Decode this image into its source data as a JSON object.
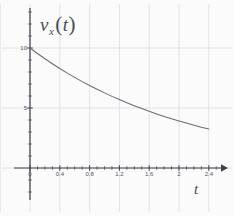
{
  "chart_data": {
    "type": "line",
    "title": "",
    "subtitle": "",
    "ylabel": "v_x(t)",
    "ylabel_parts": {
      "symbol": "v",
      "subscript": "x",
      "argument": "t"
    },
    "xlabel": "t",
    "xlim": [
      0,
      2.55
    ],
    "ylim": [
      0,
      12.0
    ],
    "grid": true,
    "legend": null,
    "xticks": [
      {
        "value": 0,
        "label": "0"
      },
      {
        "value": 0.4,
        "label": "0.4"
      },
      {
        "value": 0.8,
        "label": "0.8"
      },
      {
        "value": 1.2,
        "label": "1.2"
      },
      {
        "value": 1.6,
        "label": "1.6"
      },
      {
        "value": 2.0,
        "label": "2"
      },
      {
        "value": 2.4,
        "label": "2.4"
      }
    ],
    "yticks": [
      {
        "value": 5,
        "label": "5"
      },
      {
        "value": 10,
        "label": "10"
      }
    ],
    "minor_xtick_step": 0.1,
    "minor_ytick_step": 1,
    "series": [
      {
        "name": "v_x(t)",
        "color": "#6b6b73",
        "x": [
          0,
          0.1,
          0.2,
          0.3,
          0.4,
          0.5,
          0.6,
          0.7,
          0.8,
          0.9,
          1.0,
          1.1,
          1.2,
          1.3,
          1.4,
          1.5,
          1.6,
          1.7,
          1.8,
          1.9,
          2.0,
          2.1,
          2.2,
          2.3,
          2.4
        ],
        "y": [
          10.0,
          9.54,
          9.1,
          8.69,
          8.29,
          7.91,
          7.55,
          7.2,
          6.87,
          6.56,
          6.26,
          5.97,
          5.7,
          5.44,
          5.19,
          4.95,
          4.72,
          4.51,
          4.3,
          4.1,
          3.92,
          3.74,
          3.57,
          3.4,
          3.25
        ]
      }
    ],
    "annotations": []
  },
  "axes": {
    "x_axis_name": "time-axis",
    "y_axis_name": "velocity-axis",
    "arrow_x": true,
    "arrow_y": false
  },
  "colors": {
    "background": "#fbfbfb",
    "grid": "#dedbe6",
    "axis": "#3f3f47",
    "curve": "#6b6b73",
    "text": "#4a4a52"
  }
}
